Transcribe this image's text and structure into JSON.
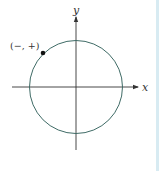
{
  "diagram": {
    "type": "unit-circle-quadrant-sign",
    "axes": {
      "x_label": "x",
      "y_label": "y"
    },
    "point": {
      "label": "(−, +)",
      "quadrant": "II"
    },
    "colors": {
      "circle": "#3f6b66",
      "axes": "#333333",
      "point": "#111111",
      "border": "#d8ebf2"
    }
  }
}
